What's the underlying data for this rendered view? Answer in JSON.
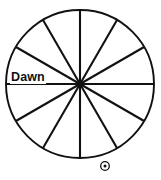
{
  "figure": {
    "background_color": "#ffffff",
    "line_color": "#111111",
    "width": 161,
    "height": 180
  },
  "labels": {
    "dawn": "Dawn",
    "bottom_caption": ""
  },
  "icons": {
    "sun_symbol": "⊙"
  },
  "chart_data": {
    "type": "pie",
    "subtitle": "",
    "xlabel": "",
    "ylabel": "",
    "grid": false,
    "legend_position": "none",
    "center_x": 80,
    "center_y": 84,
    "radius": 74,
    "sector_count": 12,
    "sector_angle_degrees": 30,
    "equal_sectors": true,
    "categories": [
      "S1",
      "S2",
      "S3",
      "S4",
      "S5",
      "S6",
      "S7",
      "S8",
      "S9",
      "S10",
      "S11",
      "S12"
    ],
    "values": [
      8.3333,
      8.3333,
      8.3333,
      8.3333,
      8.3333,
      8.3333,
      8.3333,
      8.3333,
      8.3333,
      8.3333,
      8.3333,
      8.3333
    ],
    "spoke_angles_degrees": [
      0,
      30,
      60,
      90,
      120,
      150
    ],
    "annotations": [
      {
        "text": "Dawn",
        "angle_degrees": 180,
        "position": "left-of-center-above-horizontal-diameter",
        "x": 10,
        "y": 71,
        "bold": true
      },
      {
        "text": "⊙",
        "position": "below-circle",
        "x": 105,
        "y": 166,
        "meaning": "sun-symbol"
      }
    ]
  }
}
